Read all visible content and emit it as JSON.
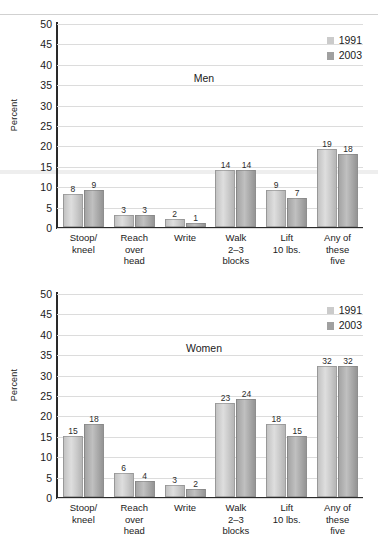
{
  "chart_data": [
    {
      "type": "bar",
      "title": "Men",
      "xlabel": "",
      "ylabel": "Percent",
      "ylim": [
        0,
        50
      ],
      "yticks": [
        0,
        5,
        10,
        15,
        20,
        25,
        30,
        35,
        40,
        45,
        50
      ],
      "grid": true,
      "legend_position": "top-right",
      "categories": [
        "Stoop/\nkneel",
        "Reach\nover\nhead",
        "Write",
        "Walk\n2–3\nblocks",
        "Lift\n10 lbs.",
        "Any of\nthese\nfive"
      ],
      "series": [
        {
          "name": "1991",
          "color": "#cbcbcb",
          "values": [
            8,
            3,
            2,
            14,
            9,
            19
          ]
        },
        {
          "name": "2003",
          "color": "#a0a0a0",
          "values": [
            9,
            3,
            1,
            14,
            7,
            18
          ]
        }
      ]
    },
    {
      "type": "bar",
      "title": "Women",
      "xlabel": "",
      "ylabel": "Percent",
      "ylim": [
        0,
        50
      ],
      "yticks": [
        0,
        5,
        10,
        15,
        20,
        25,
        30,
        35,
        40,
        45,
        50
      ],
      "grid": true,
      "legend_position": "top-right",
      "categories": [
        "Stoop/\nkneel",
        "Reach\nover\nhead",
        "Write",
        "Walk\n2–3\nblocks",
        "Lift\n10 lbs.",
        "Any of\nthese\nfive"
      ],
      "series": [
        {
          "name": "1991",
          "color": "#cbcbcb",
          "values": [
            15,
            6,
            3,
            23,
            18,
            32
          ]
        },
        {
          "name": "2003",
          "color": "#a0a0a0",
          "values": [
            18,
            4,
            2,
            24,
            15,
            32
          ]
        }
      ]
    }
  ]
}
